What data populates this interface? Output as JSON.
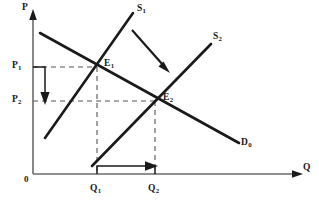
{
  "figure": {
    "type": "supply-demand-shift-diagram",
    "title": "",
    "axes": {
      "y_label": "P",
      "x_label": "Q",
      "origin_label": "0",
      "y_axis_name": "price-axis",
      "x_axis_name": "quantity-axis"
    },
    "curves": [
      {
        "id": "S1",
        "label": "S",
        "sub": "1",
        "name": "supply-curve-s1",
        "kind": "supply"
      },
      {
        "id": "S2",
        "label": "S",
        "sub": "2",
        "name": "supply-curve-s2",
        "kind": "supply"
      },
      {
        "id": "D0",
        "label": "D",
        "sub": "0",
        "name": "demand-curve-d0",
        "kind": "demand"
      }
    ],
    "points": [
      {
        "id": "E1",
        "label": "E",
        "sub": "1",
        "name": "equilibrium-point-e1"
      },
      {
        "id": "E2",
        "label": "E",
        "sub": "2",
        "name": "equilibrium-point-e2"
      }
    ],
    "price_ticks": [
      {
        "id": "P1",
        "label": "P",
        "sub": "1",
        "name": "price-label-p1"
      },
      {
        "id": "P2",
        "label": "P",
        "sub": "2",
        "name": "price-label-p2"
      }
    ],
    "quantity_ticks": [
      {
        "id": "Q1",
        "label": "Q",
        "sub": "1",
        "name": "quantity-label-q1"
      },
      {
        "id": "Q2",
        "label": "Q",
        "sub": "2",
        "name": "quantity-label-q2"
      }
    ],
    "annotations": [
      {
        "id": "shift-arrow",
        "name": "supply-shift-arrow",
        "meaning": "supply curve shifts right"
      },
      {
        "id": "price-arrow",
        "name": "price-decrease-arrow",
        "meaning": "price falls from P1 to P2"
      },
      {
        "id": "quantity-arrow",
        "name": "quantity-increase-arrow",
        "meaning": "quantity rises from Q1 to Q2"
      }
    ],
    "colors": {
      "ink": "#1a1a1a",
      "axis": "#6b6b6b",
      "dashed": "#555555",
      "background": "#ffffff"
    }
  }
}
